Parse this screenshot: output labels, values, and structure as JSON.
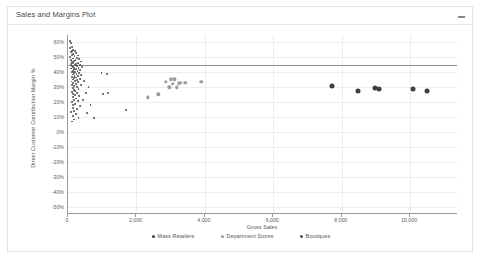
{
  "card": {
    "title": "Sales and Margins Plot",
    "menu_icon": "ellipsis-horizontal-icon"
  },
  "chart_data": {
    "type": "scatter",
    "title": "Sales and Margins Plot",
    "xlabel": "Gross Sales",
    "ylabel": "Direct Customer Contribution Margin %",
    "xlim": [
      0,
      11400
    ],
    "ylim": [
      -0.55,
      0.65
    ],
    "grid": true,
    "legend_position": "bottom",
    "xticks": [
      "0",
      "2,000",
      "4,000",
      "6,000",
      "8,000",
      "10,000"
    ],
    "xtick_values": [
      0,
      2000,
      4000,
      6000,
      8000,
      10000
    ],
    "yticks": [
      "60%",
      "50%",
      "40%",
      "30%",
      "20%",
      "10%",
      "0%",
      "-10%",
      "-20%",
      "-30%",
      "-40%",
      "-50%"
    ],
    "ytick_values": [
      0.6,
      0.5,
      0.4,
      0.3,
      0.2,
      0.1,
      0,
      -0.1,
      -0.2,
      -0.3,
      -0.4,
      -0.5
    ],
    "reference_line": {
      "y": 0.45,
      "orientation": "horizontal",
      "color": "#8d8d8d"
    },
    "series": [
      {
        "name": "Mass Retailers",
        "color": "#3f3f3f",
        "marker_size": 5,
        "points": [
          [
            7720,
            0.305
          ],
          [
            8480,
            0.277
          ],
          [
            8970,
            0.292
          ],
          [
            9080,
            0.288
          ],
          [
            10090,
            0.287
          ],
          [
            10490,
            0.272
          ]
        ]
      },
      {
        "name": "Department Stores",
        "color": "#9c9c9c",
        "marker_size": 3.4,
        "points": [
          [
            2330,
            0.232
          ],
          [
            2640,
            0.252
          ],
          [
            2860,
            0.336
          ],
          [
            2960,
            0.3
          ],
          [
            3000,
            0.352
          ],
          [
            3060,
            0.322
          ],
          [
            3110,
            0.352
          ],
          [
            3180,
            0.3
          ],
          [
            3240,
            0.327
          ],
          [
            3300,
            0.33
          ],
          [
            3430,
            0.33
          ],
          [
            3900,
            0.338
          ]
        ]
      },
      {
        "name": "Boutiques",
        "color": "#4d4d4d",
        "marker_size": 1.9,
        "points": [
          [
            60,
            0.612
          ],
          [
            95,
            0.598
          ],
          [
            130,
            0.571
          ],
          [
            70,
            0.56
          ],
          [
            150,
            0.552
          ],
          [
            110,
            0.545
          ],
          [
            200,
            0.54
          ],
          [
            85,
            0.533
          ],
          [
            240,
            0.528
          ],
          [
            160,
            0.521
          ],
          [
            120,
            0.515
          ],
          [
            300,
            0.512
          ],
          [
            190,
            0.506
          ],
          [
            70,
            0.5
          ],
          [
            260,
            0.497
          ],
          [
            140,
            0.492
          ],
          [
            330,
            0.489
          ],
          [
            100,
            0.484
          ],
          [
            220,
            0.48
          ],
          [
            180,
            0.476
          ],
          [
            380,
            0.472
          ],
          [
            130,
            0.468
          ],
          [
            290,
            0.464
          ],
          [
            160,
            0.461
          ],
          [
            90,
            0.457
          ],
          [
            240,
            0.453
          ],
          [
            200,
            0.45
          ],
          [
            350,
            0.447
          ],
          [
            120,
            0.444
          ],
          [
            270,
            0.441
          ],
          [
            150,
            0.437
          ],
          [
            410,
            0.434
          ],
          [
            180,
            0.431
          ],
          [
            310,
            0.428
          ],
          [
            100,
            0.425
          ],
          [
            230,
            0.421
          ],
          [
            170,
            0.418
          ],
          [
            360,
            0.415
          ],
          [
            135,
            0.411
          ],
          [
            280,
            0.408
          ],
          [
            205,
            0.404
          ],
          [
            110,
            0.4
          ],
          [
            320,
            0.397
          ],
          [
            165,
            0.393
          ],
          [
            250,
            0.389
          ],
          [
            145,
            0.385
          ],
          [
            390,
            0.381
          ],
          [
            190,
            0.377
          ],
          [
            300,
            0.373
          ],
          [
            120,
            0.369
          ],
          [
            225,
            0.365
          ],
          [
            175,
            0.36
          ],
          [
            340,
            0.356
          ],
          [
            140,
            0.351
          ],
          [
            265,
            0.347
          ],
          [
            200,
            0.342
          ],
          [
            105,
            0.338
          ],
          [
            290,
            0.333
          ],
          [
            160,
            0.328
          ],
          [
            235,
            0.322
          ],
          [
            130,
            0.317
          ],
          [
            370,
            0.312
          ],
          [
            185,
            0.306
          ],
          [
            255,
            0.3
          ],
          [
            145,
            0.294
          ],
          [
            310,
            0.288
          ],
          [
            170,
            0.281
          ],
          [
            215,
            0.275
          ],
          [
            115,
            0.268
          ],
          [
            275,
            0.261
          ],
          [
            155,
            0.254
          ],
          [
            195,
            0.247
          ],
          [
            330,
            0.24
          ],
          [
            135,
            0.232
          ],
          [
            240,
            0.224
          ],
          [
            175,
            0.216
          ],
          [
            290,
            0.208
          ],
          [
            120,
            0.199
          ],
          [
            205,
            0.19
          ],
          [
            160,
            0.181
          ],
          [
            350,
            0.172
          ],
          [
            140,
            0.162
          ],
          [
            255,
            0.152
          ],
          [
            185,
            0.142
          ],
          [
            100,
            0.131
          ],
          [
            225,
            0.12
          ],
          [
            150,
            0.108
          ],
          [
            310,
            0.096
          ],
          [
            170,
            0.083
          ],
          [
            130,
            0.07
          ],
          [
            980,
            0.392
          ],
          [
            1150,
            0.388
          ],
          [
            1020,
            0.256
          ],
          [
            1180,
            0.262
          ],
          [
            1700,
            0.146
          ],
          [
            660,
            0.178
          ],
          [
            760,
            0.096
          ],
          [
            430,
            0.215
          ],
          [
            520,
            0.262
          ],
          [
            600,
            0.3
          ],
          [
            480,
            0.34
          ],
          [
            560,
            0.128
          ]
        ]
      }
    ]
  }
}
